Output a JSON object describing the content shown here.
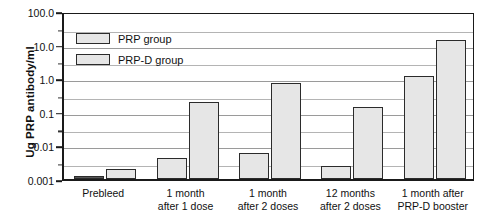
{
  "chart_data": {
    "type": "bar",
    "title": "",
    "xlabel": "",
    "ylabel": "Ug PRP antibody/ml",
    "yscale": "log",
    "ylim": [
      0.001,
      100.0
    ],
    "grid": true,
    "legend_position": "top-left",
    "ytick_labels": [
      "100.0",
      "10.0",
      "1.0",
      "0.1",
      "0.01",
      "0.001"
    ],
    "ytick_values": [
      100.0,
      10.0,
      1.0,
      0.1,
      0.01,
      0.001
    ],
    "categories": [
      "Prebleed",
      "1 month\nafter 1 dose",
      "1 month\nafter 2 doses",
      "12 months\nafter 2 doses",
      "1 month after\nPRP-D booster"
    ],
    "series": [
      {
        "name": "PRP group",
        "color": "#e6e6e6",
        "values": [
          0.0012,
          0.0043,
          0.006,
          0.0025,
          1.2
        ]
      },
      {
        "name": "PRP-D group",
        "color": "#e6e6e6",
        "values": [
          0.002,
          0.2,
          0.7,
          0.14,
          14.0
        ]
      }
    ]
  },
  "legend": {
    "items": [
      {
        "label": "PRP group"
      },
      {
        "label": "PRP-D group"
      }
    ]
  },
  "axis": {
    "y_title": "Ug PRP antibody/ml"
  }
}
